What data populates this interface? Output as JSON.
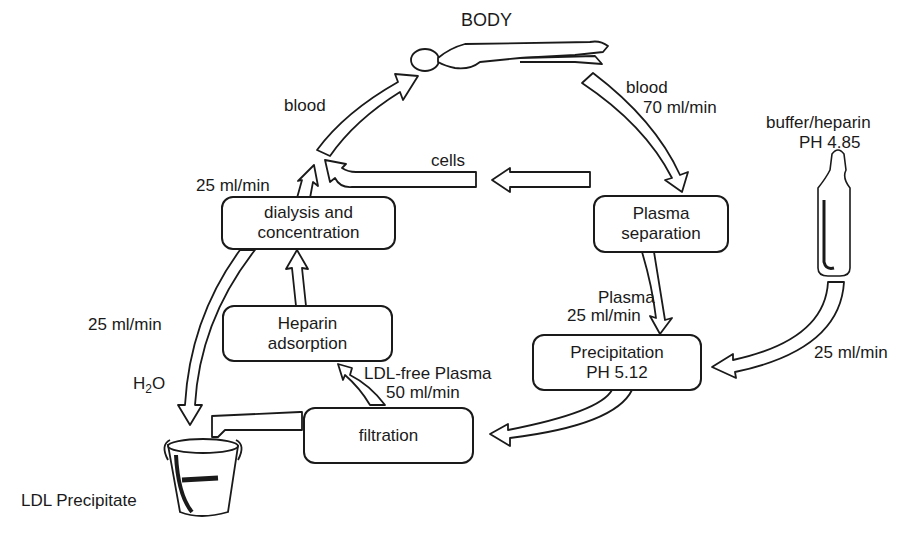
{
  "diagram": {
    "title_node": "BODY",
    "nodes": {
      "plasma_separation": [
        "Plasma",
        "separation"
      ],
      "precipitation": [
        "Precipitation",
        "PH 5.12"
      ],
      "filtration": [
        "filtration"
      ],
      "heparin_adsorption": [
        "Heparin",
        "adsorption"
      ],
      "dialysis": [
        "dialysis and",
        "concentration"
      ]
    },
    "source": {
      "buffer_line1": "buffer/heparin",
      "buffer_line2": "PH 4.85"
    },
    "sink": {
      "label": "LDL Precipitate"
    },
    "edge_labels": {
      "blood_out_line1": "blood",
      "blood_out_line2": "70 ml/min",
      "blood_in": "blood",
      "cells": "cells",
      "dialysis_out": "25 ml/min",
      "plasma_line1": "Plasma",
      "plasma_line2": "25 ml/min",
      "buffer_flow": "25 ml/min",
      "ldl_free_line1": "LDL-free Plasma",
      "ldl_free_line2": "50 ml/min",
      "water_flow": "25 ml/min",
      "water_label": "H",
      "water_sub": "2",
      "water_o": "O"
    },
    "edges": [
      {
        "from": "BODY",
        "to": "Plasma separation",
        "label": "blood 70 ml/min"
      },
      {
        "from": "Plasma separation",
        "to": "Precipitation",
        "label": "Plasma 25 ml/min"
      },
      {
        "from": "buffer/heparin",
        "to": "Precipitation",
        "label": "25 ml/min"
      },
      {
        "from": "Precipitation",
        "to": "filtration"
      },
      {
        "from": "filtration",
        "to": "LDL Precipitate"
      },
      {
        "from": "filtration",
        "to": "Heparin adsorption",
        "label": "LDL-free Plasma 50 ml/min"
      },
      {
        "from": "Heparin adsorption",
        "to": "dialysis and concentration"
      },
      {
        "from": "dialysis and concentration",
        "to": "LDL Precipitate",
        "label": "25 ml/min H2O"
      },
      {
        "from": "dialysis and concentration",
        "to": "BODY",
        "label": "25 ml/min"
      },
      {
        "from": "Plasma separation",
        "to": "BODY",
        "label": "cells"
      },
      {
        "from": "merge",
        "to": "BODY",
        "label": "blood"
      }
    ]
  }
}
